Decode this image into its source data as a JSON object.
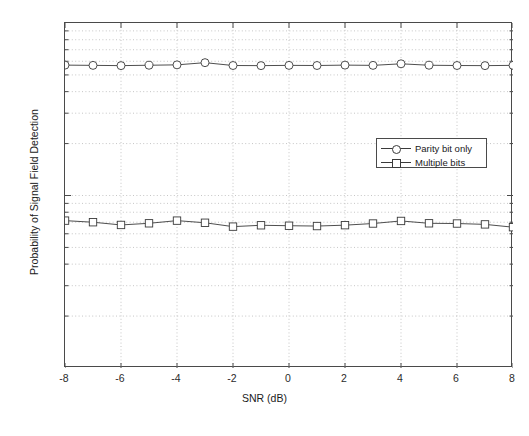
{
  "chart_data": {
    "type": "line",
    "title": "",
    "xlabel": "SNR (dB)",
    "ylabel": "Probability of Signal Field Detection",
    "xlim": [
      -8,
      8
    ],
    "ylim": [
      0.01,
      1
    ],
    "yscale": "log",
    "grid": true,
    "xticks": [
      -8,
      -6,
      -4,
      -2,
      0,
      2,
      4,
      6,
      8
    ],
    "xticklabels": [
      "-8",
      "-6",
      "-4",
      "-2",
      "0",
      "2",
      "4",
      "6",
      "8"
    ],
    "yticks": [
      1,
      0.1,
      0.01
    ],
    "yticklabels": [
      "10",
      "10",
      "10"
    ],
    "ytickexponents": [
      "0",
      "-1",
      "-2"
    ],
    "legend_position": "center right",
    "x": [
      -8,
      -7,
      -6,
      -5,
      -4,
      -3,
      -2,
      -1,
      0,
      1,
      2,
      3,
      4,
      5,
      6,
      7,
      8
    ],
    "series": [
      {
        "name": "Parity bit only",
        "marker": "circle",
        "values": [
          0.57,
          0.568,
          0.566,
          0.569,
          0.572,
          0.589,
          0.567,
          0.566,
          0.568,
          0.567,
          0.57,
          0.568,
          0.58,
          0.569,
          0.567,
          0.566,
          0.568
        ]
      },
      {
        "name": "Multiple bits",
        "marker": "square",
        "values": [
          0.0715,
          0.07,
          0.0675,
          0.069,
          0.0715,
          0.0695,
          0.066,
          0.0672,
          0.0668,
          0.0665,
          0.0673,
          0.0688,
          0.0712,
          0.069,
          0.0688,
          0.068,
          0.0655
        ]
      }
    ]
  },
  "legend": {
    "items": [
      {
        "label": "Parity bit only"
      },
      {
        "label": "Multiple bits"
      }
    ]
  },
  "caption": ""
}
